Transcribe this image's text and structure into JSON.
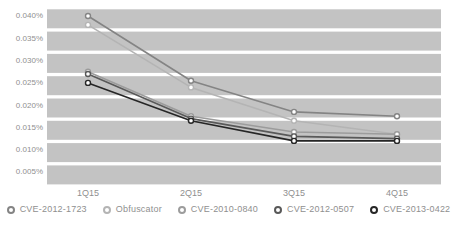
{
  "chart": {
    "background_color": "#ffffff",
    "band_color": "#c3c3c3",
    "axis_label_color": "#8f8f8f",
    "legend_text_color": "#8f8f8f"
  },
  "chart_data": {
    "type": "line",
    "title": "",
    "xlabel": "",
    "ylabel": "",
    "unit": "%",
    "grid": "horizontal-bands",
    "legend_position": "bottom",
    "categories": [
      "1Q15",
      "2Q15",
      "3Q15",
      "4Q15"
    ],
    "y_ticks": [
      "0.040%",
      "0.035%",
      "0.030%",
      "0.025%",
      "0.020%",
      "0.015%",
      "0.010%",
      "0.005%"
    ],
    "y_tick_values": [
      0.04,
      0.035,
      0.03,
      0.025,
      0.02,
      0.015,
      0.01,
      0.005
    ],
    "ylim": [
      0.005,
      0.04
    ],
    "series": [
      {
        "name": "CVE-2012-1723",
        "color": "#848484",
        "values": [
          0.0385,
          0.024,
          0.017,
          0.016
        ]
      },
      {
        "name": "Obfuscator",
        "color": "#b4b4b4",
        "values": [
          0.0365,
          0.0225,
          0.015,
          0.012
        ]
      },
      {
        "name": "CVE-2010-0840",
        "color": "#9c9c9c",
        "values": [
          0.026,
          0.016,
          0.0125,
          0.012
        ]
      },
      {
        "name": "CVE-2012-0507",
        "color": "#595959",
        "values": [
          0.0255,
          0.0155,
          0.0115,
          0.011
        ]
      },
      {
        "name": "CVE-2013-0422",
        "color": "#262626",
        "values": [
          0.0235,
          0.015,
          0.0105,
          0.0105
        ]
      }
    ]
  }
}
